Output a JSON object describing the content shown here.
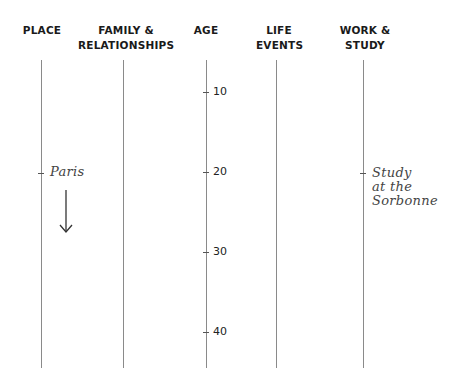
{
  "columns": [
    {
      "id": "place",
      "label_lines": [
        "PLACE"
      ]
    },
    {
      "id": "family",
      "label_lines": [
        "FAMILY &",
        "RELATIONSHIPS"
      ]
    },
    {
      "id": "age",
      "label_lines": [
        "AGE"
      ]
    },
    {
      "id": "life",
      "label_lines": [
        "LIFE",
        "EVENTS"
      ]
    },
    {
      "id": "work",
      "label_lines": [
        "WORK &",
        "STUDY"
      ]
    }
  ],
  "age_axis": {
    "ticks": [
      "10",
      "20",
      "30",
      "40"
    ]
  },
  "annotations": {
    "place": {
      "text": "Paris",
      "age": 20,
      "arrow": "down"
    },
    "work": {
      "lines": [
        "Study",
        "at the",
        "Sorbonne"
      ],
      "age": 20
    }
  }
}
